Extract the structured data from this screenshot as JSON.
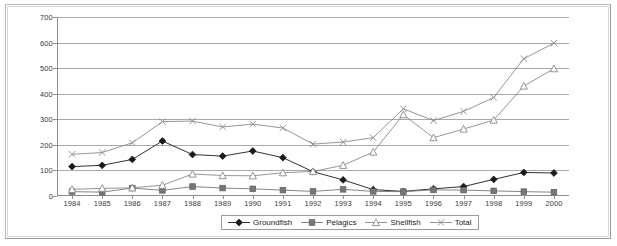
{
  "chart_data": {
    "type": "line",
    "title": "",
    "subtitle": "",
    "xlabel": "",
    "ylabel": "",
    "ylim": [
      0,
      700
    ],
    "ytick_step": 100,
    "yticks": [
      0,
      100,
      200,
      300,
      400,
      500,
      600,
      700
    ],
    "grid": true,
    "legend_position": "bottom",
    "categories": [
      "1984",
      "1985",
      "1986",
      "1987",
      "1988",
      "1989",
      "1990",
      "1991",
      "1992",
      "1993",
      "1994",
      "1995",
      "1996",
      "1997",
      "1998",
      "1999",
      "2000"
    ],
    "series": [
      {
        "name": "Groundfish",
        "marker": "diamond",
        "color": "#1a1a1a",
        "values": [
          115,
          120,
          143,
          215,
          162,
          156,
          176,
          150,
          95,
          63,
          25,
          18,
          28,
          37,
          65,
          92,
          90
        ]
      },
      {
        "name": "Pelagics",
        "marker": "square",
        "color": "#777777",
        "values": [
          17,
          15,
          31,
          22,
          37,
          31,
          28,
          23,
          18,
          26,
          18,
          17,
          24,
          23,
          20,
          17,
          15
        ]
      },
      {
        "name": "Shellfish",
        "marker": "triangle",
        "color": "#8a8a8a",
        "values": [
          26,
          30,
          32,
          42,
          86,
          80,
          79,
          91,
          96,
          120,
          172,
          318,
          228,
          262,
          297,
          430,
          498
        ]
      },
      {
        "name": "Total",
        "marker": "x",
        "color": "#8a8a8a",
        "values": [
          163,
          170,
          208,
          291,
          293,
          270,
          281,
          266,
          203,
          211,
          228,
          341,
          295,
          331,
          385,
          537,
          598
        ]
      }
    ]
  },
  "legend": {
    "entries": [
      {
        "label": "Groundfish",
        "marker": "diamond"
      },
      {
        "label": "Pelagics",
        "marker": "square"
      },
      {
        "label": "Shellfish",
        "marker": "triangle"
      },
      {
        "label": "Total",
        "marker": "x"
      }
    ]
  },
  "colors": {
    "groundfish": "#1a1a1a",
    "pelagics": "#777777",
    "shellfish": "#8a8a8a",
    "total": "#8a8a8a",
    "gridline": "#a9a9a9",
    "axis": "#8d8d8d",
    "text": "#3a3a3a",
    "frame": "#b9b9b9"
  }
}
